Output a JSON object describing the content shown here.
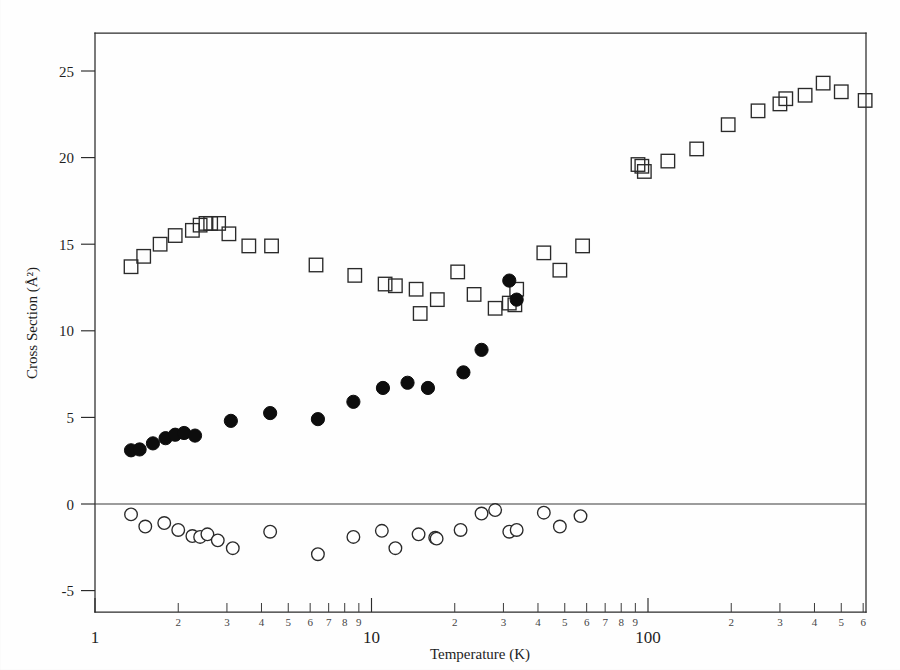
{
  "figure": {
    "kind": "scatter-plot",
    "background_color": "#fefefe",
    "ink_color": "#2a2a2a"
  },
  "axes": {
    "x_title": "Temperature (K)",
    "y_title": "Cross Section (Å²)",
    "x_scale": "log",
    "y_scale": "linear",
    "x_major_labels": [
      "1",
      "10",
      "100"
    ],
    "x_minor_labels": [
      "2",
      "3",
      "4",
      "5",
      "6",
      "7",
      "8",
      "9"
    ],
    "y_tick_labels": [
      "25",
      "20",
      "15",
      "10",
      "5",
      "0",
      "-5"
    ],
    "zero_reference_line": true
  },
  "chart_data": {
    "type": "scatter",
    "title": "",
    "xlabel": "Temperature (K)",
    "ylabel": "Cross Section (Å²)",
    "xscale": "log",
    "yscale": "linear",
    "xlim": [
      1.0,
      670.0
    ],
    "ylim": [
      -6.5,
      27.5
    ],
    "grid": false,
    "legend": "none",
    "xticks_major": [
      1,
      10,
      100
    ],
    "xticks_minor": [
      2,
      3,
      4,
      5,
      6,
      7,
      8,
      9,
      20,
      30,
      40,
      50,
      60,
      70,
      80,
      90,
      200,
      300,
      400,
      500,
      600
    ],
    "yticks": [
      -5,
      0,
      5,
      10,
      15,
      20,
      25
    ],
    "annotations": [
      {
        "text": "zero reference line drawn at y = 0 across full plot width"
      }
    ],
    "series": [
      {
        "name": "open-squares",
        "marker": "open square",
        "marker_color": "#2a2a2a",
        "marker_fill": "none",
        "x": [
          1.35,
          1.5,
          1.72,
          1.95,
          2.25,
          2.4,
          2.52,
          2.62,
          2.8,
          3.05,
          3.6,
          4.35,
          6.3,
          8.7,
          11.2,
          12.2,
          14.5,
          15.0,
          17.3,
          20.5,
          23.5,
          28.0,
          31.5,
          33.0,
          33.5,
          42.0,
          48.0,
          58.0,
          92.0,
          95.0,
          97.0,
          118.0,
          150.0,
          195.0,
          250.0,
          300.0,
          315.0,
          370.0,
          430.0,
          500.0,
          610.0
        ],
        "y": [
          13.7,
          14.3,
          15.0,
          15.5,
          15.8,
          16.1,
          16.2,
          16.2,
          16.2,
          15.6,
          14.9,
          14.9,
          13.8,
          13.2,
          12.7,
          12.6,
          12.4,
          11.0,
          11.8,
          13.4,
          12.1,
          11.3,
          11.6,
          11.5,
          12.4,
          14.5,
          13.5,
          14.9,
          19.6,
          19.5,
          19.2,
          19.8,
          20.5,
          21.9,
          22.7,
          23.1,
          23.4,
          23.6,
          24.3,
          23.8,
          23.3
        ]
      },
      {
        "name": "filled-circles",
        "marker": "filled circle",
        "marker_color": "#0d0d0d",
        "marker_fill": "#0d0d0d",
        "x": [
          1.35,
          1.45,
          1.62,
          1.8,
          1.95,
          2.1,
          2.3,
          3.1,
          4.3,
          6.4,
          8.6,
          11.0,
          13.5,
          16.0,
          21.5,
          25.0,
          31.5,
          33.5
        ],
        "y": [
          3.1,
          3.15,
          3.5,
          3.8,
          4.0,
          4.1,
          3.95,
          4.8,
          5.25,
          4.9,
          5.9,
          6.7,
          7.0,
          6.7,
          7.6,
          8.9,
          12.9,
          11.8
        ]
      },
      {
        "name": "open-circles-residuals",
        "marker": "open circle",
        "marker_color": "#2a2a2a",
        "marker_fill": "#ffffff",
        "x": [
          1.35,
          1.52,
          1.78,
          2.0,
          2.25,
          2.4,
          2.55,
          2.78,
          3.15,
          4.3,
          6.4,
          8.6,
          10.9,
          12.2,
          14.8,
          17.0,
          17.2,
          21.0,
          25.0,
          28.0,
          31.5,
          33.5,
          42.0,
          48.0,
          57.0
        ],
        "y": [
          -0.6,
          -1.3,
          -1.1,
          -1.5,
          -1.85,
          -1.9,
          -1.75,
          -2.1,
          -2.55,
          -1.6,
          -2.9,
          -1.9,
          -1.55,
          -2.55,
          -1.75,
          -1.95,
          -2.0,
          -1.5,
          -0.55,
          -0.35,
          -1.6,
          -1.5,
          -0.5,
          -1.3,
          -0.7
        ]
      }
    ]
  }
}
